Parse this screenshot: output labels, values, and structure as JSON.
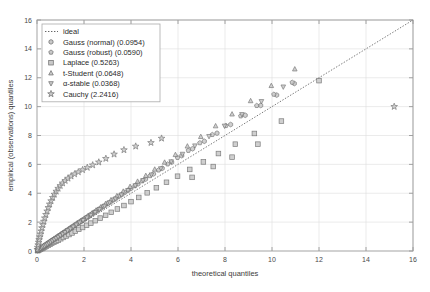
{
  "chart_data": {
    "type": "scatter",
    "title": "",
    "xlabel": "theoretical quantiles",
    "ylabel": "empirical (observations) quantiles",
    "xlim": [
      0,
      16
    ],
    "ylim": [
      0,
      16
    ],
    "xticks": [
      0,
      2,
      4,
      6,
      8,
      10,
      12,
      14,
      16
    ],
    "yticks": [
      0,
      2,
      4,
      6,
      8,
      10,
      12,
      14,
      16
    ],
    "xticklabels": [
      "0",
      "2",
      "4",
      "6",
      "8",
      "10",
      "12",
      "14",
      "16"
    ],
    "yticklabels": [
      "0",
      "2",
      "4",
      "6",
      "8",
      "10",
      "12",
      "14",
      "16"
    ],
    "grid": true,
    "legend_position": "upper-left",
    "reference_line": {
      "name": "ideal",
      "style": "dotted",
      "color": "#555555",
      "from": [
        0,
        0
      ],
      "to": [
        16,
        16
      ]
    },
    "series": [
      {
        "name": "ideal",
        "label": "ideal",
        "marker": "line",
        "color": "#555555",
        "metric": null,
        "x": [],
        "y": []
      },
      {
        "name": "gauss-normal",
        "label": "Gauss (normal) (0.0954)",
        "metric": 0.0954,
        "marker": "hexagon",
        "color": "#7a7a7a",
        "x": [
          0.02,
          0.05,
          0.09,
          0.13,
          0.17,
          0.21,
          0.26,
          0.31,
          0.36,
          0.41,
          0.47,
          0.53,
          0.59,
          0.66,
          0.73,
          0.8,
          0.88,
          0.96,
          1.05,
          1.14,
          1.24,
          1.34,
          1.45,
          1.57,
          1.69,
          1.82,
          1.96,
          2.11,
          2.27,
          2.44,
          2.62,
          2.81,
          3.02,
          3.24,
          3.48,
          3.73,
          4.0,
          4.3,
          4.62,
          4.96,
          5.33,
          5.73,
          6.16,
          6.62,
          7.12,
          7.66,
          8.24,
          8.86,
          9.52,
          10.2,
          10.95
        ],
        "y": [
          0.03,
          0.07,
          0.11,
          0.15,
          0.2,
          0.25,
          0.3,
          0.36,
          0.42,
          0.48,
          0.54,
          0.61,
          0.68,
          0.75,
          0.83,
          0.91,
          1.0,
          1.09,
          1.19,
          1.29,
          1.4,
          1.51,
          1.63,
          1.76,
          1.89,
          2.03,
          2.18,
          2.34,
          2.51,
          2.69,
          2.88,
          3.08,
          3.3,
          3.53,
          3.78,
          4.05,
          4.34,
          4.65,
          4.98,
          5.34,
          5.73,
          6.15,
          6.6,
          7.08,
          7.6,
          8.16,
          8.76,
          9.4,
          10.08,
          10.8,
          11.6
        ]
      },
      {
        "name": "gauss-robust",
        "label": "Gauss (robust) (0.0590)",
        "metric": 0.059,
        "marker": "pentagon",
        "color": "#8a8a8a",
        "x": [
          0.02,
          0.06,
          0.1,
          0.14,
          0.19,
          0.24,
          0.29,
          0.34,
          0.4,
          0.46,
          0.52,
          0.59,
          0.66,
          0.73,
          0.81,
          0.89,
          0.98,
          1.07,
          1.17,
          1.27,
          1.38,
          1.49,
          1.61,
          1.74,
          1.88,
          2.02,
          2.18,
          2.34,
          2.52,
          2.71,
          2.91,
          3.13,
          3.36,
          3.61,
          3.88,
          4.17,
          4.48,
          4.81,
          5.17,
          5.56,
          5.98,
          6.44,
          6.93,
          7.46,
          8.04,
          8.67,
          9.35,
          10.08,
          10.86
        ],
        "y": [
          0.03,
          0.07,
          0.12,
          0.17,
          0.22,
          0.27,
          0.33,
          0.39,
          0.45,
          0.52,
          0.59,
          0.66,
          0.74,
          0.82,
          0.9,
          0.99,
          1.09,
          1.19,
          1.29,
          1.4,
          1.52,
          1.64,
          1.77,
          1.91,
          2.06,
          2.21,
          2.38,
          2.56,
          2.75,
          2.95,
          3.17,
          3.4,
          3.65,
          3.92,
          4.21,
          4.52,
          4.85,
          5.21,
          5.6,
          6.02,
          6.47,
          6.96,
          7.49,
          8.06,
          8.68,
          9.35,
          10.07,
          10.85,
          11.68
        ]
      },
      {
        "name": "laplace",
        "label": "Laplace (0.5263)",
        "metric": 0.5263,
        "marker": "square",
        "color": "#9a9a9a",
        "x": [
          0.03,
          0.08,
          0.14,
          0.2,
          0.26,
          0.33,
          0.4,
          0.47,
          0.55,
          0.63,
          0.72,
          0.81,
          0.91,
          1.01,
          1.12,
          1.24,
          1.36,
          1.49,
          1.63,
          1.78,
          1.94,
          2.11,
          2.29,
          2.48,
          2.69,
          2.92,
          3.16,
          3.42,
          3.7,
          4.0,
          4.33,
          4.69,
          5.08,
          5.51,
          5.98,
          6.5,
          7.08,
          7.72,
          8.44,
          9.25,
          6.6,
          7.5,
          8.3,
          9.4,
          10.4,
          12.0
        ],
        "y": [
          0.02,
          0.06,
          0.11,
          0.16,
          0.21,
          0.27,
          0.33,
          0.39,
          0.46,
          0.53,
          0.6,
          0.68,
          0.76,
          0.85,
          0.94,
          1.04,
          1.14,
          1.25,
          1.37,
          1.5,
          1.63,
          1.78,
          1.93,
          2.1,
          2.28,
          2.47,
          2.68,
          2.91,
          3.15,
          3.42,
          3.71,
          4.03,
          4.38,
          4.76,
          5.18,
          5.65,
          6.17,
          6.75,
          7.4,
          8.14,
          5.1,
          5.85,
          6.5,
          7.4,
          9.0,
          11.8
        ]
      },
      {
        "name": "t-student",
        "label": "t-Student (0.0648)",
        "metric": 0.0648,
        "marker": "triangle-up",
        "color": "#8f8f8f",
        "x": [
          0.02,
          0.06,
          0.1,
          0.15,
          0.2,
          0.25,
          0.3,
          0.36,
          0.42,
          0.48,
          0.55,
          0.62,
          0.69,
          0.77,
          0.85,
          0.94,
          1.03,
          1.13,
          1.23,
          1.34,
          1.46,
          1.58,
          1.71,
          1.85,
          2.0,
          2.16,
          2.33,
          2.51,
          2.71,
          2.92,
          3.15,
          3.4,
          3.67,
          3.96,
          4.28,
          4.63,
          5.01,
          5.43,
          5.89,
          6.4,
          6.97,
          7.6,
          8.3,
          9.09,
          9.97,
          10.97
        ],
        "y": [
          0.03,
          0.07,
          0.12,
          0.17,
          0.22,
          0.28,
          0.34,
          0.4,
          0.47,
          0.54,
          0.61,
          0.69,
          0.77,
          0.86,
          0.95,
          1.05,
          1.15,
          1.26,
          1.38,
          1.5,
          1.63,
          1.77,
          1.92,
          2.07,
          2.24,
          2.42,
          2.61,
          2.82,
          3.04,
          3.28,
          3.54,
          3.82,
          4.13,
          4.46,
          4.82,
          5.22,
          5.66,
          6.14,
          6.67,
          7.26,
          7.92,
          8.66,
          9.48,
          10.4,
          11.45,
          12.6
        ]
      },
      {
        "name": "alpha-stable",
        "label": "α-stable (0.0368)",
        "metric": 0.0368,
        "marker": "triangle-down",
        "color": "#7f7f7f",
        "x": [
          0.02,
          0.06,
          0.11,
          0.16,
          0.21,
          0.26,
          0.32,
          0.38,
          0.44,
          0.51,
          0.58,
          0.65,
          0.73,
          0.81,
          0.9,
          0.99,
          1.09,
          1.19,
          1.3,
          1.42,
          1.54,
          1.67,
          1.81,
          1.96,
          2.12,
          2.29,
          2.47,
          2.66,
          2.87,
          3.09,
          3.33,
          3.59,
          3.87,
          4.18,
          4.51,
          4.87,
          5.27,
          5.71,
          6.19,
          6.72,
          7.32,
          7.98,
          8.72,
          9.55,
          10.48
        ],
        "y": [
          0.03,
          0.07,
          0.12,
          0.17,
          0.23,
          0.29,
          0.35,
          0.41,
          0.48,
          0.55,
          0.63,
          0.71,
          0.79,
          0.88,
          0.97,
          1.07,
          1.18,
          1.29,
          1.41,
          1.53,
          1.67,
          1.81,
          1.96,
          2.12,
          2.3,
          2.48,
          2.68,
          2.89,
          3.11,
          3.35,
          3.61,
          3.89,
          4.2,
          4.53,
          4.89,
          5.28,
          5.71,
          6.19,
          6.71,
          7.29,
          7.94,
          8.66,
          9.46,
          10.36,
          11.37
        ]
      },
      {
        "name": "cauchy",
        "label": "Cauchy (2.2416)",
        "metric": 2.2416,
        "marker": "star",
        "color": "#6e6e6e",
        "x": [
          0.01,
          0.03,
          0.05,
          0.07,
          0.09,
          0.12,
          0.15,
          0.18,
          0.21,
          0.25,
          0.29,
          0.33,
          0.38,
          0.43,
          0.48,
          0.54,
          0.6,
          0.67,
          0.74,
          0.82,
          0.9,
          0.99,
          1.09,
          1.2,
          1.32,
          1.45,
          1.6,
          1.76,
          1.94,
          2.14,
          2.37,
          2.63,
          2.93,
          3.28,
          3.7,
          4.2,
          4.85,
          5.3,
          15.2
        ],
        "y": [
          0.1,
          0.25,
          0.42,
          0.6,
          0.78,
          0.97,
          1.17,
          1.38,
          1.6,
          1.82,
          2.05,
          2.28,
          2.52,
          2.76,
          3.0,
          3.24,
          3.47,
          3.7,
          3.92,
          4.13,
          4.33,
          4.52,
          4.7,
          4.87,
          5.03,
          5.18,
          5.33,
          5.47,
          5.62,
          5.78,
          5.95,
          6.15,
          6.4,
          6.7,
          7.0,
          7.25,
          7.5,
          7.8,
          10.0
        ]
      }
    ]
  },
  "legend": {
    "entries": [
      {
        "label": "ideal",
        "marker": "line"
      },
      {
        "label": "Gauss (normal) (0.0954)",
        "marker": "hexagon"
      },
      {
        "label": "Gauss (robust) (0.0590)",
        "marker": "pentagon"
      },
      {
        "label": "Laplace (0.5263)",
        "marker": "square"
      },
      {
        "label": "t-Student (0.0648)",
        "marker": "triangle-up"
      },
      {
        "label": "α-stable (0.0368)",
        "marker": "triangle-down"
      },
      {
        "label": "Cauchy (2.2416)",
        "marker": "star"
      }
    ]
  },
  "axes": {
    "x_title": "theoretical quantiles",
    "y_title": "empirical (observations) quantiles"
  },
  "colors": {
    "background": "#ffffff",
    "axis": "#9a9a9a",
    "grid": "#dedede",
    "marker_edge": "#6b6b6b",
    "marker_fill": "#c9c9c9",
    "text": "#3c3c3c",
    "legend_border": "#aaaaaa"
  }
}
